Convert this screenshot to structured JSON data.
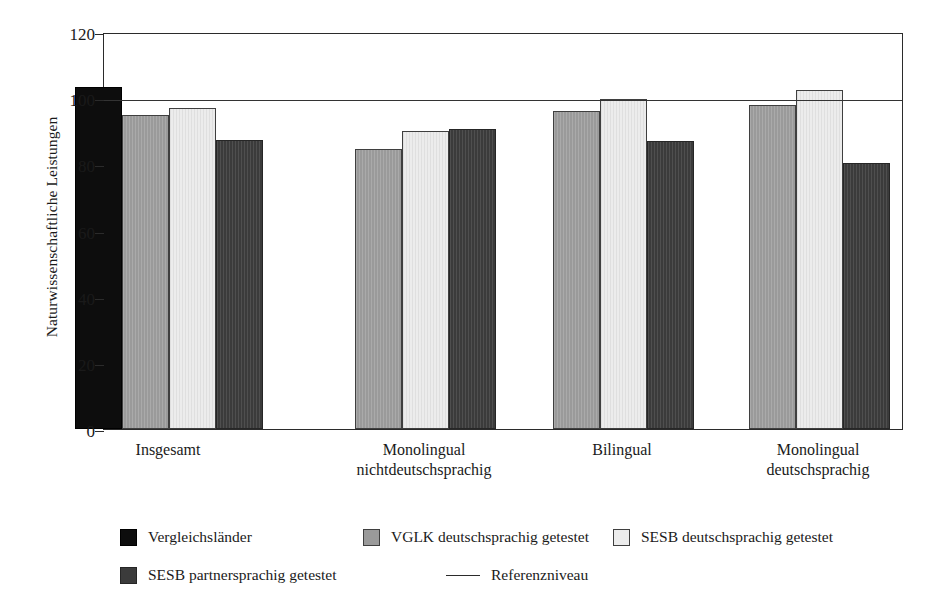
{
  "chart_data": {
    "type": "bar",
    "title": "",
    "subtitle": "",
    "xlabel": "",
    "ylabel": "Naturwissenschaftliche Leistungen",
    "ylim": [
      0,
      120
    ],
    "yticks": [
      0,
      20,
      40,
      60,
      80,
      100,
      120
    ],
    "ytick_labels": [
      "0",
      "20",
      "40",
      "60",
      "80",
      "100",
      "120"
    ],
    "grid": false,
    "legend_position": "bottom",
    "categories": [
      "Insgesamt",
      "Monolingual nichtdeutschsprachig",
      "Bilingual",
      "Monolingual deutschsprachig"
    ],
    "category_lines": [
      [
        "Insgesamt",
        ""
      ],
      [
        "Monolingual",
        "nichtdeutschsprachig"
      ],
      [
        "Bilingual",
        ""
      ],
      [
        "Monolingual",
        "deutschsprachig"
      ]
    ],
    "series": [
      {
        "name": "Vergleichsländer",
        "swatch": "s0",
        "values": [
          103.5,
          null,
          null,
          null
        ]
      },
      {
        "name": "VGLK deutschsprachig getestet",
        "swatch": "s1",
        "values": [
          95.0,
          84.5,
          96.0,
          98.0
        ]
      },
      {
        "name": "SESB deutschsprachig getestet",
        "swatch": "s2",
        "values": [
          97.0,
          90.0,
          99.8,
          102.5
        ]
      },
      {
        "name": "SESB partnersprachig getestet",
        "swatch": "s3",
        "values": [
          87.5,
          90.8,
          87.2,
          80.3
        ]
      }
    ],
    "annotations": [
      {
        "type": "hline",
        "label": "Referenzniveau",
        "value": 100
      }
    ]
  },
  "legend": {
    "rows": [
      [
        {
          "label": "Vergleichsländer",
          "swatch": "s0",
          "kind": "box"
        },
        {
          "label": "VGLK deutschsprachig getestet",
          "swatch": "s1",
          "kind": "box"
        },
        {
          "label": "SESB deutschsprachig getestet",
          "swatch": "s2",
          "kind": "box"
        }
      ],
      [
        {
          "label": "SESB partnersprachig getestet",
          "swatch": "s3",
          "kind": "box"
        },
        {
          "label": "Referenzniveau",
          "swatch": "line",
          "kind": "line"
        }
      ]
    ]
  },
  "colors": {
    "series_0": "#0d0d0d",
    "series_1": "#9a9a9a",
    "series_2": "#ececec",
    "series_3": "#3b3b3b",
    "axis": "#2b2b2b",
    "reference_line": "#333333",
    "background": "#ffffff"
  }
}
